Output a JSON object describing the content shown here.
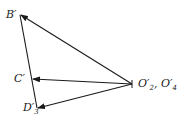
{
  "diagram": {
    "type": "vector-polygon",
    "colors": {
      "line": "#1a1a1a",
      "background": "#ffffff"
    },
    "points": {
      "B": {
        "label": "B′",
        "x": 20,
        "y": 15
      },
      "C": {
        "label": "C′",
        "x": 33,
        "y": 79
      },
      "D": {
        "label": "D′",
        "sub": "3",
        "x": 37,
        "y": 108
      },
      "O": {
        "label": "O′",
        "sub": "2",
        "label2": ", O′",
        "sub2": "4",
        "x": 132,
        "y": 84
      }
    },
    "vectors": [
      {
        "from": "O",
        "to": "B",
        "arrow": true
      },
      {
        "from": "O",
        "to": "C",
        "arrow": true
      },
      {
        "from": "O",
        "to": "D",
        "arrow": true
      },
      {
        "from": "B",
        "to": "D",
        "arrow": false
      }
    ]
  }
}
